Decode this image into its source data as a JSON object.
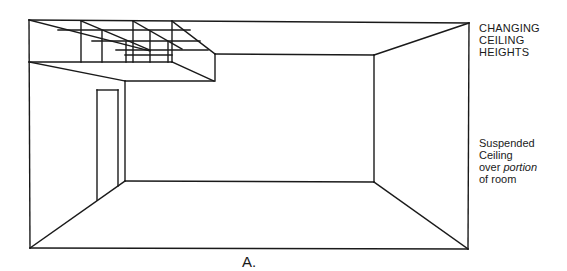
{
  "figure": {
    "label": "A.",
    "annotations": {
      "top": [
        "CHANGING",
        "CEILING",
        "HEIGHTS"
      ],
      "side": {
        "line1": "Suspended",
        "line2": "Ceiling",
        "line3_pre": "over ",
        "line3_italic": "portion",
        "line4": "of room"
      }
    },
    "elements": {
      "room": "room-perspective",
      "ceiling": "suspended-ceiling-grid",
      "door": "door"
    },
    "colors": {
      "line": "#1a1a1a",
      "background": "#ffffff"
    }
  }
}
